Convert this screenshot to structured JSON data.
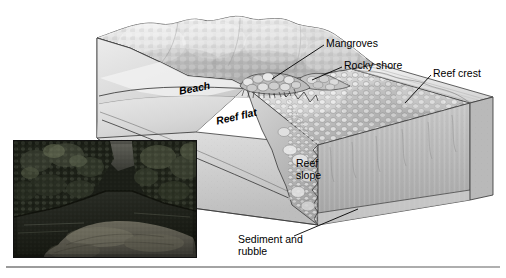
{
  "figure": {
    "type": "geologic-block-diagram",
    "background_color": "#ffffff",
    "line_color": "#1a1a1a",
    "labels": [
      {
        "id": "mangroves",
        "text": "Mangroves",
        "style": "upright",
        "x": 326,
        "y": 38
      },
      {
        "id": "rocky-shore",
        "text": "Rocky shore",
        "style": "upright",
        "x": 344,
        "y": 60
      },
      {
        "id": "reef-crest",
        "text": "Reef crest",
        "style": "upright",
        "x": 433,
        "y": 68
      },
      {
        "id": "beach",
        "text": "Beach",
        "style": "italic",
        "x": 178,
        "y": 86
      },
      {
        "id": "reef-flat",
        "text": "Reef flat",
        "style": "italic",
        "x": 215,
        "y": 116
      },
      {
        "id": "reef-slope",
        "text": "Reef\nslope",
        "style": "upright",
        "x": 296,
        "y": 158
      },
      {
        "id": "sediment",
        "text": "Sediment and\nrubble",
        "style": "upright",
        "x": 238,
        "y": 234
      }
    ],
    "leader_lines": [
      {
        "id": "leader-mangroves",
        "from": [
          324,
          45
        ],
        "to": [
          272,
          79
        ]
      },
      {
        "id": "leader-rocky-shore",
        "from": [
          342,
          67
        ],
        "to": [
          310,
          80
        ]
      },
      {
        "id": "leader-reef-crest",
        "from": [
          431,
          75
        ],
        "to": [
          407,
          102
        ]
      },
      {
        "id": "leader-sediment",
        "from": [
          294,
          235
        ],
        "to": [
          356,
          209
        ]
      }
    ],
    "photo_inset": {
      "id": "photo-inset",
      "caption": "",
      "description": "Grayscale photograph of a mangrove-lined tidal shoreline with dark forested banks and a shallow sediment flat in the foreground",
      "x": 13,
      "y": 140,
      "width": 184,
      "height": 118,
      "border_color": "#111111"
    },
    "bottom_rule": {
      "id": "bottom-rule",
      "x": 6,
      "y": 266,
      "width": 494
    }
  }
}
